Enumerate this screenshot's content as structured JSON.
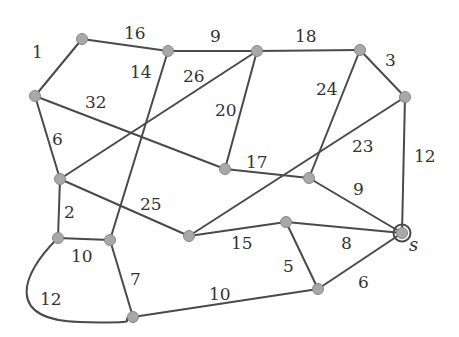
{
  "diagram": {
    "type": "weighted-undirected-graph",
    "source_label": "s",
    "colors": {
      "edge": "#4a4a4a",
      "node_fill": "#a8a8a8",
      "label": "#333333"
    },
    "nodes": [
      {
        "id": "A",
        "x": 82,
        "y": 39
      },
      {
        "id": "B",
        "x": 168,
        "y": 51
      },
      {
        "id": "C",
        "x": 257,
        "y": 51
      },
      {
        "id": "D",
        "x": 360,
        "y": 50
      },
      {
        "id": "E",
        "x": 405,
        "y": 97
      },
      {
        "id": "F",
        "x": 35,
        "y": 96
      },
      {
        "id": "G",
        "x": 60,
        "y": 179
      },
      {
        "id": "H",
        "x": 225,
        "y": 169
      },
      {
        "id": "I",
        "x": 309,
        "y": 178
      },
      {
        "id": "J",
        "x": 58,
        "y": 238
      },
      {
        "id": "K",
        "x": 110,
        "y": 240
      },
      {
        "id": "L",
        "x": 189,
        "y": 236
      },
      {
        "id": "M",
        "x": 286,
        "y": 222
      },
      {
        "id": "S",
        "x": 402,
        "y": 233,
        "source": true
      },
      {
        "id": "N",
        "x": 133,
        "y": 317
      },
      {
        "id": "O",
        "x": 318,
        "y": 289
      }
    ],
    "edges": [
      {
        "from": "A",
        "to": "F",
        "weight": "1",
        "lx": 32,
        "ly": 58
      },
      {
        "from": "A",
        "to": "B",
        "weight": "16",
        "lx": 124,
        "ly": 39
      },
      {
        "from": "B",
        "to": "C",
        "weight": "9",
        "lx": 210,
        "ly": 42
      },
      {
        "from": "C",
        "to": "D",
        "weight": "18",
        "lx": 295,
        "ly": 42
      },
      {
        "from": "D",
        "to": "E",
        "weight": "3",
        "lx": 385,
        "ly": 66
      },
      {
        "from": "E",
        "to": "S",
        "weight": "12",
        "lx": 414,
        "ly": 162
      },
      {
        "from": "B",
        "to": "K",
        "weight": "14",
        "lx": 130,
        "ly": 78
      },
      {
        "from": "C",
        "to": "G",
        "weight": "26",
        "lx": 183,
        "ly": 82
      },
      {
        "from": "F",
        "to": "H",
        "weight": "32",
        "lx": 85,
        "ly": 108
      },
      {
        "from": "C",
        "to": "H",
        "weight": "20",
        "lx": 215,
        "ly": 116
      },
      {
        "from": "F",
        "to": "G",
        "weight": "6",
        "lx": 52,
        "ly": 145
      },
      {
        "from": "D",
        "to": "I",
        "weight": "24",
        "lx": 316,
        "ly": 95
      },
      {
        "from": "E",
        "to": "L",
        "weight": "23",
        "lx": 352,
        "ly": 152
      },
      {
        "from": "H",
        "to": "I",
        "weight": "17",
        "lx": 246,
        "ly": 168
      },
      {
        "from": "I",
        "to": "S",
        "weight": "9",
        "lx": 353,
        "ly": 195
      },
      {
        "from": "G",
        "to": "J",
        "weight": "2",
        "lx": 64,
        "ly": 218
      },
      {
        "from": "G",
        "to": "L",
        "weight": "25",
        "lx": 140,
        "ly": 210
      },
      {
        "from": "J",
        "to": "K",
        "weight": "10",
        "lx": 71,
        "ly": 262
      },
      {
        "from": "K",
        "to": "N",
        "weight": "7",
        "lx": 130,
        "ly": 285
      },
      {
        "from": "J",
        "to": "N",
        "weight": "12",
        "lx": 40,
        "ly": 305,
        "curved": true
      },
      {
        "from": "L",
        "to": "M",
        "weight": "15",
        "lx": 231,
        "ly": 249
      },
      {
        "from": "M",
        "to": "S",
        "weight": "8",
        "lx": 341,
        "ly": 249
      },
      {
        "from": "M",
        "to": "O",
        "weight": "5",
        "lx": 283,
        "ly": 272
      },
      {
        "from": "O",
        "to": "S",
        "weight": "6",
        "lx": 358,
        "ly": 288
      },
      {
        "from": "N",
        "to": "O",
        "weight": "10",
        "lx": 209,
        "ly": 300
      }
    ]
  }
}
